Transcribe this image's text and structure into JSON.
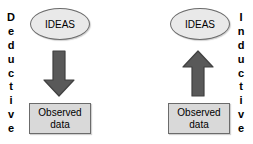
{
  "diagram": {
    "background_color": "#ffffff",
    "node_fill_ellipse": "#e9e9e9",
    "node_fill_rect": "#d9d9d9",
    "node_border": "#6b6b6b",
    "arrow_fill": "#595959",
    "arrow_border": "#404040"
  },
  "panels": [
    {
      "id": "deductive",
      "side_label": "Deductive",
      "side_label_letters": [
        "D",
        "e",
        "d",
        "u",
        "c",
        "t",
        "i",
        "v",
        "e"
      ],
      "side_label_position": "left",
      "top_node": {
        "shape": "ellipse",
        "label": "IDEAS"
      },
      "arrow": {
        "direction": "down",
        "icon": "down-block-arrow-icon"
      },
      "bottom_node": {
        "shape": "rectangle",
        "line1": "Observed",
        "line2": "data"
      }
    },
    {
      "id": "inductive",
      "side_label": "Inductive",
      "side_label_letters": [
        "I",
        "n",
        "d",
        "u",
        "c",
        "t",
        "i",
        "v",
        "e"
      ],
      "side_label_position": "right",
      "top_node": {
        "shape": "ellipse",
        "label": "IDEAS"
      },
      "arrow": {
        "direction": "up",
        "icon": "up-block-arrow-icon"
      },
      "bottom_node": {
        "shape": "rectangle",
        "line1": "Observed",
        "line2": "data"
      }
    }
  ]
}
